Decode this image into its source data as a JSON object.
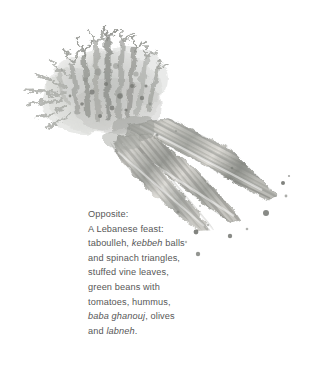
{
  "page": {
    "background_color": "#ffffff",
    "text_color": "#575757"
  },
  "illustration": {
    "name": "watercolor-carrots-illustration",
    "subject": "two carrots with feathery green tops, painted in desaturated grayscale watercolor with ink splatter dots",
    "palette": {
      "foliage_light": "#d8d8d6",
      "foliage_mid": "#b4b5b2",
      "foliage_dark": "#8a8c88",
      "root_light": "#e0dfdb",
      "root_mid": "#b9b8b3",
      "root_dark": "#7f817c",
      "splatter": "#6f716c"
    }
  },
  "caption": {
    "name": "figure-caption",
    "lines": [
      {
        "id": "line1",
        "segments": [
          {
            "text": "Opposite:",
            "italic": false
          }
        ]
      },
      {
        "id": "line2",
        "segments": [
          {
            "text": "A Lebanese feast:",
            "italic": false
          }
        ]
      },
      {
        "id": "line3",
        "segments": [
          {
            "text": "taboulleh, ",
            "italic": false
          },
          {
            "text": "kebbeh",
            "italic": true
          },
          {
            "text": " balls",
            "italic": false
          }
        ]
      },
      {
        "id": "line4",
        "segments": [
          {
            "text": "and spinach triangles,",
            "italic": false
          }
        ]
      },
      {
        "id": "line5",
        "segments": [
          {
            "text": "stuffed vine leaves,",
            "italic": false
          }
        ]
      },
      {
        "id": "line6",
        "segments": [
          {
            "text": "green beans with",
            "italic": false
          }
        ]
      },
      {
        "id": "line7",
        "segments": [
          {
            "text": "tomatoes, hummus,",
            "italic": false
          }
        ]
      },
      {
        "id": "line8",
        "segments": [
          {
            "text": "baba ghanouj",
            "italic": true
          },
          {
            "text": ", olives",
            "italic": false
          }
        ]
      },
      {
        "id": "line9",
        "segments": [
          {
            "text": "and ",
            "italic": false
          },
          {
            "text": "labneh",
            "italic": true
          },
          {
            "text": ".",
            "italic": false
          }
        ]
      }
    ],
    "plain_text": "Opposite: A Lebanese feast: taboulleh, kebbeh balls and spinach triangles, stuffed vine leaves, green beans with tomatoes, hummus, baba ghanouj, olives and labneh."
  }
}
